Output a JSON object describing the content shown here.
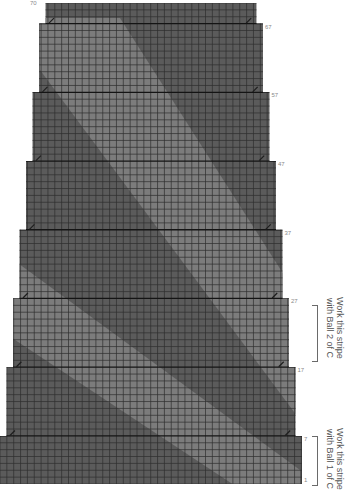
{
  "chart": {
    "type": "knitting-chart",
    "rows": 70,
    "colors": {
      "main": "#5b5b5b",
      "stripe": "#7c7c7c",
      "grid": "#2e2e2e",
      "grid_major": "#141414",
      "decrease_mark": "#1e1e1e"
    },
    "row_labels": [
      {
        "text": "70",
        "row": 70,
        "side": "left"
      },
      {
        "text": "67",
        "row": 67,
        "side": "right"
      },
      {
        "text": "57",
        "row": 57,
        "side": "right"
      },
      {
        "text": "47",
        "row": 47,
        "side": "right"
      },
      {
        "text": "37",
        "row": 37,
        "side": "right"
      },
      {
        "text": "27",
        "row": 27,
        "side": "right"
      },
      {
        "text": "17",
        "row": 17,
        "side": "right"
      },
      {
        "text": "7",
        "row": 7,
        "side": "right"
      },
      {
        "text": "1",
        "row": 1,
        "side": "right"
      }
    ],
    "decrease_rows": [
      67,
      57,
      47,
      37,
      27,
      17,
      7
    ]
  },
  "annotations": [
    {
      "line1": "Work this stripe",
      "line2": "with Ball 2 of C",
      "from_row": 26,
      "to_row": 19
    },
    {
      "line1": "Work this stripe",
      "line2": "with Ball 1 of C",
      "from_row": 7,
      "to_row": 1
    }
  ],
  "chart_data": {
    "type": "table",
    "title": "",
    "rows": 70,
    "stitch_count_by_section": [
      {
        "rows": "1-7",
        "shape": "full width"
      },
      {
        "rows": "8-17",
        "shape": "1 st decreased each side at row 7"
      },
      {
        "rows": "18-27",
        "shape": "1 st decreased each side at row 17"
      },
      {
        "rows": "28-37",
        "shape": "1 st decreased each side at row 27"
      },
      {
        "rows": "38-47",
        "shape": "1 st decreased each side at row 37"
      },
      {
        "rows": "48-57",
        "shape": "1 st decreased each side at row 47"
      },
      {
        "rows": "58-67",
        "shape": "1 st decreased each side at row 57"
      },
      {
        "rows": "68-70",
        "shape": "1 st decreased each side at row 67"
      }
    ],
    "row_labels": [
      "1",
      "7",
      "17",
      "27",
      "37",
      "47",
      "57",
      "67",
      "70"
    ],
    "legend": [
      "Work this stripe with Ball 1 of C",
      "Work this stripe with Ball 2 of C"
    ]
  }
}
